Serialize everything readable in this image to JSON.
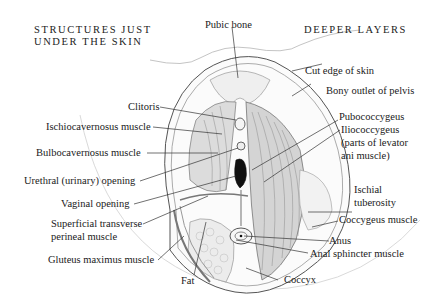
{
  "headings": {
    "left_line1": "STRUCTURES JUST",
    "left_line2": "UNDER THE SKIN",
    "right": "DEEPER LAYERS"
  },
  "labels": {
    "pubic_bone": "Pubic bone",
    "cut_edge_of_skin": "Cut edge of skin",
    "bony_outlet_of_pelvis": "Bony outlet of pelvis",
    "clitoris": "Clitoris",
    "ischiocavernosus": "Ischiocavernosus muscle",
    "bulbocavernosus": "Bulbocavernosus muscle",
    "pubococcygeus": "Pubococcygeus",
    "iliococcygeus": "Iliococcygeus",
    "levator_line1": "(parts of levator",
    "levator_line2": "ani muscle)",
    "urethral_opening": "Urethral (urinary) opening",
    "vaginal_opening": "Vaginal opening",
    "ischial_line1": "Ischial",
    "ischial_line2": "tuberosity",
    "superficial_line1": "Superficial transverse",
    "superficial_line2": "perineal muscle",
    "coccygeus": "Coccygeus muscle",
    "anus": "Anus",
    "anal_sphincter": "Anal sphincter muscle",
    "gluteus": "Gluteus maximus muscle",
    "fat": "Fat",
    "coccyx": "Coccyx"
  },
  "colors": {
    "ink": "#1a1a1a",
    "line": "#333333",
    "sketch": "#8a8a8a",
    "bone": "#efefef",
    "muscle": "#d6d6d6"
  }
}
